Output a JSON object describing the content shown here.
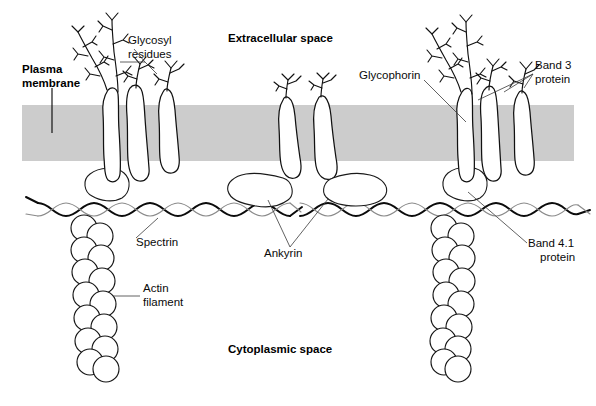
{
  "figure": {
    "background_color": "#ffffff",
    "membrane_color": "#cccccc",
    "ink_color": "#111111"
  },
  "region_labels": {
    "extracellular": "Extracellular space",
    "cytoplasmic": "Cytoplasmic space",
    "plasma_membrane": "Plasma\nmembrane",
    "plasma_membrane_line1": "Plasma",
    "plasma_membrane_line2": "membrane"
  },
  "callouts": {
    "glycosyl_line1": "Glycosyl",
    "glycosyl_line2": "residues",
    "glycophorin": "Glycophorin",
    "band3_line1": "Band 3",
    "band3_line2": "protein",
    "spectrin": "Spectrin",
    "ankyrin": "Ankyrin",
    "band41_line1": "Band 4.1",
    "band41_line2": "protein",
    "actin_line1": "Actin",
    "actin_line2": "filament"
  },
  "structures": [
    {
      "name": "plasma-membrane-band",
      "kind": "membrane",
      "x": 22,
      "y": 105,
      "width": 552,
      "height": 56
    },
    {
      "name": "spectrin-network",
      "kind": "filament",
      "y": 210
    },
    {
      "name": "actin-filament-left",
      "kind": "actin",
      "x": 88,
      "top": 215,
      "bottom": 375,
      "subunits": 18
    },
    {
      "name": "actin-filament-right",
      "kind": "actin",
      "x": 448,
      "top": 215,
      "bottom": 375,
      "subunits": 18
    },
    {
      "name": "band3-dimer-left",
      "kind": "transmembrane-protein",
      "x": 110
    },
    {
      "name": "glycophorin-left",
      "kind": "transmembrane-protein",
      "x": 165
    },
    {
      "name": "band3-center-left",
      "kind": "transmembrane-protein",
      "x": 285
    },
    {
      "name": "band3-center-right",
      "kind": "transmembrane-protein",
      "x": 320
    },
    {
      "name": "ankyrin-left",
      "kind": "peripheral-protein",
      "x": 250
    },
    {
      "name": "ankyrin-right",
      "kind": "peripheral-protein",
      "x": 345
    },
    {
      "name": "band3-right-group",
      "kind": "transmembrane-protein",
      "x": 465
    },
    {
      "name": "band41-left",
      "kind": "peripheral-protein",
      "x": 108
    },
    {
      "name": "band41-right",
      "kind": "peripheral-protein",
      "x": 455
    }
  ]
}
